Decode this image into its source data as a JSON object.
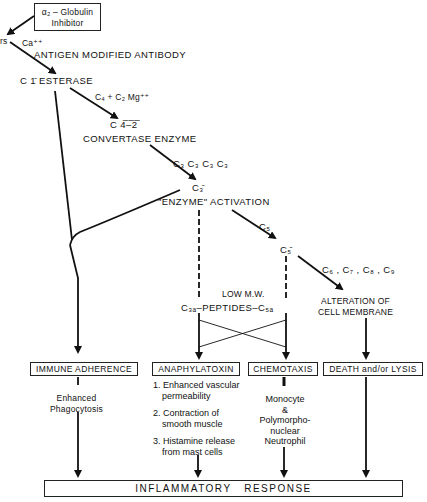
{
  "inhibitor_box": {
    "line1": "α₂ – Globulin",
    "line2": "Inhibitor"
  },
  "left_fragment": "rs",
  "ca": "Ca⁺⁺",
  "antigen": "ANTIGEN MODIFIED ANTIBODY",
  "c1_esterase": "C 1̄  ESTERASE",
  "c4c2": "C₄ + C₂  Mg⁺⁺",
  "c42": "C 4̅–̅2̅",
  "convertase": "CONVERTASE ENZYME",
  "c3_series": "C₃  C₃  C₃  C₃",
  "c3bar": "C₃̄",
  "enzyme_activation": "\"ENZYME\" ACTIVATION",
  "c5": "C₅",
  "c5bar": "C₅̄",
  "c6_9": "C₆ , C₇ , C₈ , C₉",
  "low_mw": "LOW M.W.",
  "peptides": "C₃ₐ–PEPTIDES–C₅ₐ",
  "alteration": {
    "line1": "ALTERATION OF",
    "line2": "CELL MEMBRANE"
  },
  "boxes": {
    "immune_adherence": "IMMUNE ADHERENCE",
    "anaphylatoxin": "ANAPHYLATOXIN",
    "chemotaxis": "CHEMOTAXIS",
    "death_lysis": "DEATH and/or LYSIS"
  },
  "immune_effect": {
    "line1": "Enhanced",
    "line2": "Phagocytosis"
  },
  "anaphylatoxin_effects": [
    {
      "line1": "1. Enhanced vascular",
      "line2": "permeability"
    },
    {
      "line1": "2. Contraction of",
      "line2": "smooth muscle"
    },
    {
      "line1": "3. Histamine release",
      "line2": "from mast cells"
    }
  ],
  "chemotaxis_effect": [
    "Monocyte",
    "&",
    "Polymorpho-",
    "nuclear",
    "Neutrophil"
  ],
  "inflammatory_response": "INFLAMMATORY   RESPONSE"
}
